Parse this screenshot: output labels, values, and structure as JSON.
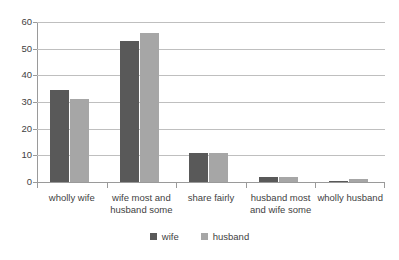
{
  "chart_data": {
    "type": "bar",
    "title": "",
    "subtitle": "",
    "xlabel": "",
    "ylabel": "",
    "ylim": [
      0,
      60
    ],
    "ytick_step": 10,
    "yticks": [
      "0",
      "10",
      "20",
      "30",
      "40",
      "50",
      "60"
    ],
    "grid": true,
    "grid_axis": "y",
    "legend_position": "bottom-center",
    "categories": [
      "wholly wife",
      "wife most and husband some",
      "share fairly",
      "husband most and wife some",
      "wholly husband"
    ],
    "series": [
      {
        "name": "wife",
        "color": "#595959",
        "values": [
          34.5,
          53,
          11,
          2,
          0.5
        ]
      },
      {
        "name": "husband",
        "color": "#a6a6a6",
        "values": [
          31,
          56,
          11,
          2,
          1
        ]
      }
    ]
  },
  "legend": {
    "items": [
      {
        "label": "wife",
        "color": "#595959"
      },
      {
        "label": "husband",
        "color": "#a6a6a6"
      }
    ]
  },
  "colors": {
    "wife": "#595959",
    "husband": "#a6a6a6",
    "gridline": "#bfbfbf",
    "axis": "#9a9a9a",
    "text": "#3f3f3f",
    "background": "#ffffff"
  }
}
